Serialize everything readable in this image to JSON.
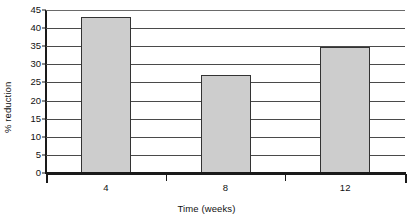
{
  "chart_data": {
    "type": "bar",
    "title": "",
    "xlabel": "Time (weeks)",
    "ylabel": "% reduction",
    "categories": [
      "4",
      "8",
      "12"
    ],
    "values": [
      43,
      27,
      34.7
    ],
    "ylim": [
      0,
      45
    ],
    "yticks": [
      0,
      5,
      10,
      15,
      20,
      25,
      30,
      35,
      40,
      45
    ],
    "ytick_labels": [
      "0",
      "5",
      "10",
      "15",
      "20",
      "25",
      "30",
      "35",
      "40",
      "45"
    ],
    "grid": true,
    "grid_axis": "y",
    "legend": "none",
    "series": [
      {
        "name": "% reduction",
        "values": [
          43,
          27,
          34.7
        ]
      }
    ],
    "colors": {
      "bar_fill": "#cdcdcd",
      "bar_edge": "#333333",
      "gridline": "#4a4a4a",
      "axis": "#1a1a1a",
      "text": "#111111",
      "background": "#ffffff"
    }
  }
}
